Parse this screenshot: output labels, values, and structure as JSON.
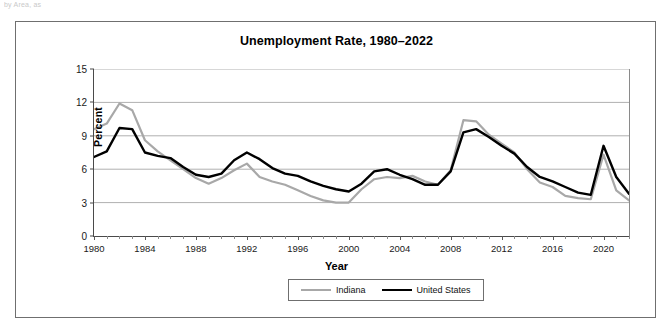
{
  "top_caption": "by Area, as",
  "chart": {
    "title": "Unemployment Rate, 1980–2022",
    "xlabel": "Year",
    "ylabel": "Percent"
  },
  "legend": {
    "position": "bottom-center",
    "items": [
      {
        "label": "Indiana",
        "color": "#a8a8a8"
      },
      {
        "label": "United States",
        "color": "#000000"
      }
    ]
  },
  "colors": {
    "indiana": "#a8a8a8",
    "united_states": "#000000",
    "gridline": "#b0b0b0",
    "axis": "#4a4a4a",
    "frame": "#6f6f6f",
    "background": "#ffffff"
  },
  "axes": {
    "y_ticks": [
      0,
      3,
      6,
      9,
      12,
      15
    ],
    "y_tick_labels": [
      "0",
      "3",
      "6",
      "9",
      "12",
      "15"
    ],
    "x_ticks": [
      1980,
      1984,
      1988,
      1992,
      1996,
      2000,
      2004,
      2008,
      2012,
      2016,
      2020
    ],
    "x_tick_labels": [
      "1980",
      "1984",
      "1988",
      "1992",
      "1996",
      "2000",
      "2004",
      "2008",
      "2012",
      "2016",
      "2020"
    ],
    "x_minor_step": 1
  },
  "chart_data": {
    "type": "line",
    "title": "Unemployment Rate, 1980–2022",
    "xlabel": "Year",
    "ylabel": "Percent",
    "xlim": [
      1980,
      2022
    ],
    "ylim": [
      0,
      15
    ],
    "grid": true,
    "legend_position": "bottom-center",
    "x": [
      1980,
      1981,
      1982,
      1983,
      1984,
      1985,
      1986,
      1987,
      1988,
      1989,
      1990,
      1991,
      1992,
      1993,
      1994,
      1995,
      1996,
      1997,
      1998,
      1999,
      2000,
      2001,
      2002,
      2003,
      2004,
      2005,
      2006,
      2007,
      2008,
      2009,
      2010,
      2011,
      2012,
      2013,
      2014,
      2015,
      2016,
      2017,
      2018,
      2019,
      2020,
      2021,
      2022
    ],
    "series": [
      {
        "name": "Indiana",
        "color": "#a8a8a8",
        "values": [
          9.6,
          10.1,
          11.9,
          11.3,
          8.6,
          7.6,
          6.8,
          6.0,
          5.2,
          4.7,
          5.2,
          5.9,
          6.5,
          5.3,
          4.9,
          4.6,
          4.1,
          3.6,
          3.2,
          3.0,
          3.0,
          4.2,
          5.1,
          5.3,
          5.2,
          5.4,
          4.9,
          4.6,
          5.9,
          10.4,
          10.3,
          9.1,
          8.3,
          7.5,
          6.0,
          4.8,
          4.4,
          3.6,
          3.4,
          3.3,
          7.3,
          4.1,
          3.2
        ]
      },
      {
        "name": "United States",
        "color": "#000000",
        "values": [
          7.1,
          7.6,
          9.7,
          9.6,
          7.5,
          7.2,
          7.0,
          6.2,
          5.5,
          5.3,
          5.6,
          6.8,
          7.5,
          6.9,
          6.1,
          5.6,
          5.4,
          4.9,
          4.5,
          4.2,
          4.0,
          4.7,
          5.8,
          6.0,
          5.5,
          5.1,
          4.6,
          4.6,
          5.8,
          9.3,
          9.6,
          8.9,
          8.1,
          7.4,
          6.2,
          5.3,
          4.9,
          4.4,
          3.9,
          3.7,
          8.1,
          5.3,
          3.8
        ]
      }
    ]
  }
}
